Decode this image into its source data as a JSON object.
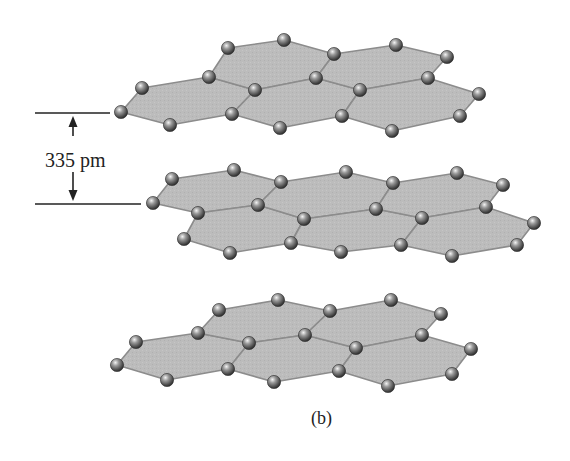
{
  "figure": {
    "caption": "(b)",
    "layer_spacing_label": "335 pm",
    "colors": {
      "sheet_fill": "#b9b9b9",
      "sheet_edge": "#8c8c8c",
      "atom": "#6f6f6f",
      "line": "#222222"
    }
  },
  "layers": [
    {
      "name": "top-layer",
      "atoms": [
        [
          121,
          112
        ],
        [
          142,
          88
        ],
        [
          170,
          125
        ],
        [
          209,
          77
        ],
        [
          228,
          48
        ],
        [
          284,
          40
        ],
        [
          255,
          90
        ],
        [
          232,
          114
        ],
        [
          280,
          128
        ],
        [
          334,
          54
        ],
        [
          396,
          45
        ],
        [
          447,
          57
        ],
        [
          316,
          78
        ],
        [
          428,
          78
        ],
        [
          360,
          90
        ],
        [
          479,
          94
        ],
        [
          342,
          116
        ],
        [
          460,
          116
        ],
        [
          392,
          131
        ]
      ],
      "hexagons": [
        [
          [
            121,
            112
          ],
          [
            142,
            88
          ],
          [
            209,
            77
          ],
          [
            255,
            90
          ],
          [
            232,
            114
          ],
          [
            170,
            125
          ]
        ],
        [
          [
            209,
            77
          ],
          [
            228,
            48
          ],
          [
            284,
            40
          ],
          [
            334,
            54
          ],
          [
            316,
            78
          ],
          [
            255,
            90
          ]
        ],
        [
          [
            255,
            90
          ],
          [
            316,
            78
          ],
          [
            360,
            90
          ],
          [
            342,
            116
          ],
          [
            280,
            128
          ],
          [
            232,
            114
          ]
        ],
        [
          [
            334,
            54
          ],
          [
            396,
            45
          ],
          [
            447,
            57
          ],
          [
            428,
            78
          ],
          [
            360,
            90
          ],
          [
            316,
            78
          ]
        ],
        [
          [
            360,
            90
          ],
          [
            428,
            78
          ],
          [
            479,
            94
          ],
          [
            460,
            116
          ],
          [
            392,
            131
          ],
          [
            342,
            116
          ]
        ]
      ]
    },
    {
      "name": "middle-layer",
      "atoms": [
        [
          153,
          203
        ],
        [
          172,
          179
        ],
        [
          234,
          170
        ],
        [
          281,
          182
        ],
        [
          258,
          205
        ],
        [
          198,
          213
        ],
        [
          184,
          239
        ],
        [
          230,
          253
        ],
        [
          291,
          243
        ],
        [
          304,
          219
        ],
        [
          346,
          172
        ],
        [
          393,
          183
        ],
        [
          457,
          173
        ],
        [
          503,
          185
        ],
        [
          376,
          209
        ],
        [
          422,
          218
        ],
        [
          486,
          207
        ],
        [
          534,
          223
        ],
        [
          341,
          252
        ],
        [
          401,
          245
        ],
        [
          452,
          256
        ],
        [
          517,
          245
        ]
      ],
      "hexagons": [
        [
          [
            153,
            203
          ],
          [
            172,
            179
          ],
          [
            234,
            170
          ],
          [
            281,
            182
          ],
          [
            258,
            205
          ],
          [
            198,
            213
          ]
        ],
        [
          [
            198,
            213
          ],
          [
            258,
            205
          ],
          [
            304,
            219
          ],
          [
            291,
            243
          ],
          [
            230,
            253
          ],
          [
            184,
            239
          ]
        ],
        [
          [
            281,
            182
          ],
          [
            346,
            172
          ],
          [
            393,
            183
          ],
          [
            376,
            209
          ],
          [
            304,
            219
          ],
          [
            258,
            205
          ]
        ],
        [
          [
            304,
            219
          ],
          [
            376,
            209
          ],
          [
            422,
            218
          ],
          [
            401,
            245
          ],
          [
            341,
            252
          ],
          [
            291,
            243
          ]
        ],
        [
          [
            393,
            183
          ],
          [
            457,
            173
          ],
          [
            503,
            185
          ],
          [
            486,
            207
          ],
          [
            422,
            218
          ],
          [
            376,
            209
          ]
        ],
        [
          [
            422,
            218
          ],
          [
            486,
            207
          ],
          [
            534,
            223
          ],
          [
            517,
            245
          ],
          [
            452,
            256
          ],
          [
            401,
            245
          ]
        ]
      ]
    },
    {
      "name": "bottom-layer",
      "atoms": [
        [
          117,
          365
        ],
        [
          136,
          342
        ],
        [
          198,
          333
        ],
        [
          219,
          310
        ],
        [
          278,
          300
        ],
        [
          249,
          343
        ],
        [
          228,
          369
        ],
        [
          167,
          380
        ],
        [
          274,
          382
        ],
        [
          305,
          335
        ],
        [
          330,
          311
        ],
        [
          391,
          300
        ],
        [
          441,
          314
        ],
        [
          422,
          335
        ],
        [
          356,
          348
        ],
        [
          471,
          349
        ],
        [
          339,
          371
        ],
        [
          452,
          374
        ],
        [
          388,
          386
        ]
      ],
      "hexagons": [
        [
          [
            117,
            365
          ],
          [
            136,
            342
          ],
          [
            198,
            333
          ],
          [
            249,
            343
          ],
          [
            228,
            369
          ],
          [
            167,
            380
          ]
        ],
        [
          [
            198,
            333
          ],
          [
            219,
            310
          ],
          [
            278,
            300
          ],
          [
            330,
            311
          ],
          [
            305,
            335
          ],
          [
            249,
            343
          ]
        ],
        [
          [
            249,
            343
          ],
          [
            305,
            335
          ],
          [
            356,
            348
          ],
          [
            339,
            371
          ],
          [
            274,
            382
          ],
          [
            228,
            369
          ]
        ],
        [
          [
            330,
            311
          ],
          [
            391,
            300
          ],
          [
            441,
            314
          ],
          [
            422,
            335
          ],
          [
            356,
            348
          ],
          [
            305,
            335
          ]
        ],
        [
          [
            356,
            348
          ],
          [
            422,
            335
          ],
          [
            471,
            349
          ],
          [
            452,
            374
          ],
          [
            388,
            386
          ],
          [
            339,
            371
          ]
        ]
      ]
    }
  ],
  "dimension": {
    "top_line": {
      "x1": 35,
      "x2": 110,
      "y": 113
    },
    "bottom_line": {
      "x1": 35,
      "x2": 141,
      "y": 204
    },
    "arrow_x": 73,
    "up_arrow": {
      "y_tip": 116,
      "y_tail": 136
    },
    "down_arrow": {
      "y_tail": 172,
      "y_tip": 201
    }
  }
}
